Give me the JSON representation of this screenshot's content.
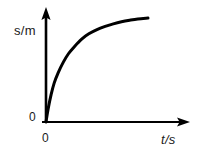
{
  "figure": {
    "background_color": "#ffffff",
    "ink_color": "#000000",
    "width": 198,
    "height": 156
  },
  "labels": {
    "y_axis": "s/m",
    "x_axis": "t/s",
    "origin_y": "0",
    "origin_x": "0"
  },
  "chart_data": {
    "type": "line",
    "title": "",
    "subtitle": "",
    "xlabel": "t/s",
    "ylabel": "s/m",
    "legend": [],
    "legend_position": "none",
    "grid": false,
    "axes": {
      "x_arrow": true,
      "y_arrow": true,
      "x_origin_tick_label": "0",
      "y_origin_tick_label": "0",
      "x_tick_labels": [],
      "y_tick_labels": [],
      "xlim": [
        0,
        1
      ],
      "ylim": [
        0,
        1
      ]
    },
    "annotations": [],
    "series": [
      {
        "name": "distance vs time",
        "description": "concave-down curve rising from the origin and flattening toward a horizontal asymptote",
        "line_color": "#000000",
        "line_width": 3,
        "x": [
          0.0,
          0.02,
          0.05,
          0.08,
          0.12,
          0.17,
          0.22,
          0.28,
          0.35,
          0.42,
          0.5,
          0.58,
          0.66,
          0.74,
          0.82,
          0.9,
          1.0
        ],
        "y": [
          0.0,
          0.12,
          0.26,
          0.37,
          0.47,
          0.57,
          0.65,
          0.72,
          0.79,
          0.84,
          0.88,
          0.91,
          0.935,
          0.955,
          0.97,
          0.982,
          0.99
        ]
      }
    ]
  }
}
